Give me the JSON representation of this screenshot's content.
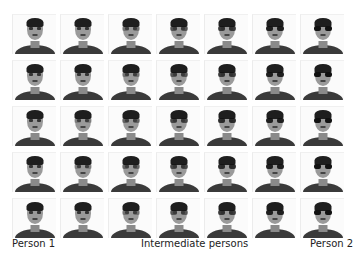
{
  "figure": {
    "rows": 5,
    "columns": 7,
    "grid": [
      {
        "row": 1,
        "cells": [
          {
            "glasses": 0
          },
          {
            "glasses": 0
          },
          {
            "glasses": 0.3
          },
          {
            "glasses": 0.5
          },
          {
            "glasses": 0.7
          },
          {
            "glasses": 0.9
          },
          {
            "glasses": 1
          }
        ]
      },
      {
        "row": 2,
        "cells": [
          {
            "glasses": 0
          },
          {
            "glasses": 0
          },
          {
            "glasses": 0.3
          },
          {
            "glasses": 0.5
          },
          {
            "glasses": 0.7
          },
          {
            "glasses": 0.9
          },
          {
            "glasses": 1
          }
        ]
      },
      {
        "row": 3,
        "cells": [
          {
            "glasses": 0
          },
          {
            "glasses": 0.2
          },
          {
            "glasses": 0.4
          },
          {
            "glasses": 0.6
          },
          {
            "glasses": 0.8
          },
          {
            "glasses": 0.9
          },
          {
            "glasses": 1
          }
        ]
      },
      {
        "row": 4,
        "cells": [
          {
            "glasses": 0
          },
          {
            "glasses": 0.2
          },
          {
            "glasses": 0.4
          },
          {
            "glasses": 0.6
          },
          {
            "glasses": 0.8
          },
          {
            "glasses": 0.9
          },
          {
            "glasses": 1
          }
        ]
      },
      {
        "row": 5,
        "cells": [
          {
            "glasses": 0
          },
          {
            "glasses": 0
          },
          {
            "glasses": 0.3
          },
          {
            "glasses": 0.5
          },
          {
            "glasses": 0.7
          },
          {
            "glasses": 0.9
          },
          {
            "glasses": 1
          }
        ]
      }
    ]
  },
  "labels": {
    "left": "Person 1",
    "center": "Intermediate persons",
    "right": "Person 2"
  }
}
